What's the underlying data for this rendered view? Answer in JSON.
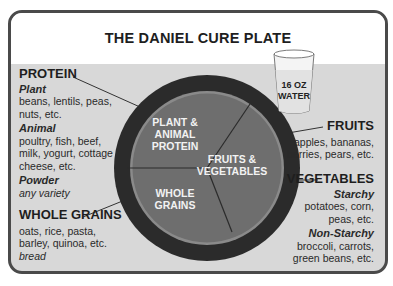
{
  "title": "THE DANIEL CURE PLATE",
  "colors": {
    "frame": "#4a4a4a",
    "background": "#d8d8d8",
    "plate_rim": "#2b2b2b",
    "plate_face": "#6e6e6e",
    "plate_text": "#f2f2f2"
  },
  "water": {
    "line1": "16 OZ",
    "line2": "WATER",
    "icon": "glass-icon"
  },
  "plate": {
    "sections": [
      {
        "line1": "PLANT &",
        "line2": "ANIMAL",
        "line3": "PROTEIN"
      },
      {
        "line1": "FRUITS &",
        "line2": "VEGETABLES"
      },
      {
        "line1": "WHOLE",
        "line2": "GRAINS"
      }
    ]
  },
  "protein": {
    "heading": "PROTEIN",
    "plant_label": "Plant",
    "plant_items_1": "beans, lentils, peas,",
    "plant_items_2": "nuts, etc.",
    "animal_label": "Animal",
    "animal_items_1": "poultry, fish, beef,",
    "animal_items_2": "milk, yogurt, cottage",
    "animal_items_3": "cheese, etc.",
    "powder_label": "Powder",
    "powder_items": "any variety"
  },
  "grains": {
    "heading": "WHOLE GRAINS",
    "items_1": "oats, rice, pasta,",
    "items_2": "barley, quinoa, etc.",
    "items_3": "bread"
  },
  "fruits": {
    "heading": "FRUITS",
    "items_1": "apples, bananas,",
    "items_2": "berries, pears, etc."
  },
  "vegetables": {
    "heading": "VEGETABLES",
    "starchy_label": "Starchy",
    "starchy_items_1": "potatoes, corn,",
    "starchy_items_2": "peas, etc.",
    "nonstarchy_label": "Non-Starchy",
    "nonstarchy_items_1": "broccoli, carrots,",
    "nonstarchy_items_2": "green beans, etc."
  }
}
